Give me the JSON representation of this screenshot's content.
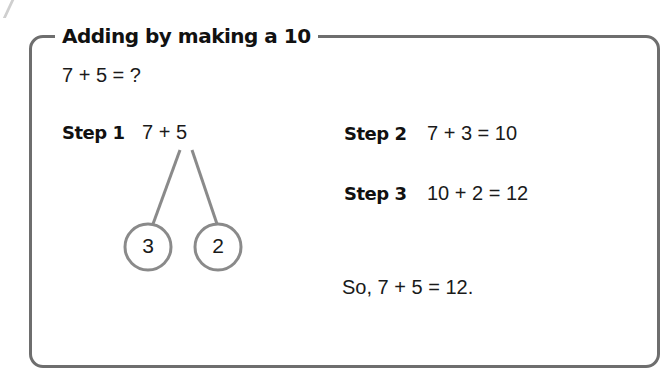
{
  "title": "Adding by making a 10",
  "question": "7 + 5 = ?",
  "step1": {
    "label": "Step 1",
    "expression": "7 + 5",
    "split": [
      "3",
      "2"
    ]
  },
  "step2": {
    "label": "Step 2",
    "expression": "7 + 3 = 10"
  },
  "step3": {
    "label": "Step 3",
    "expression": "10 + 2 = 12"
  },
  "conclusion": "So, 7 + 5 = 12.",
  "colors": {
    "frame": "#6e6e6e",
    "tree": "#8a8a8a",
    "text": "#1a1a1a"
  }
}
